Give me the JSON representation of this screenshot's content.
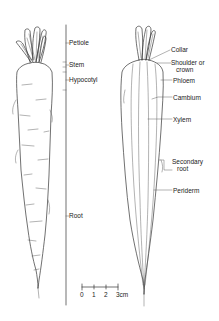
{
  "figure": {
    "left_specimen": {
      "name": "External view of carrot",
      "labels": [
        {
          "id": "petiole",
          "text": "Petiole"
        },
        {
          "id": "stem",
          "text": "Stem"
        },
        {
          "id": "hypocotyl",
          "text": "Hypocotyl"
        },
        {
          "id": "root",
          "text": "Root"
        }
      ]
    },
    "right_specimen": {
      "name": "Longitudinal section of carrot",
      "labels": [
        {
          "id": "collar",
          "text": "Collar"
        },
        {
          "id": "shoulder",
          "text": "Shoulder or",
          "text2": "crown"
        },
        {
          "id": "phloem",
          "text": "Phloem"
        },
        {
          "id": "cambium",
          "text": "Cambium"
        },
        {
          "id": "xylem",
          "text": "Xylem"
        },
        {
          "id": "secondary_root",
          "text": "Secondary",
          "text2": "root"
        },
        {
          "id": "periderm",
          "text": "Periderm"
        }
      ]
    },
    "scale_bar": {
      "ticks": [
        "0",
        "1",
        "2",
        "3cm"
      ]
    }
  }
}
